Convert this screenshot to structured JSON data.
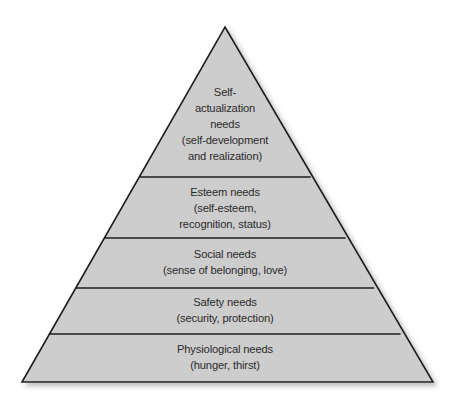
{
  "diagram": {
    "name": "maslow-hierarchy-of-needs-pyramid",
    "type": "pyramid",
    "background_color": "#ffffff",
    "fill_color": "#cdcdcd",
    "outline_color": "#1c1c1c",
    "text_color": "#2b2b2b",
    "apex": {
      "x": 225,
      "y": 27
    },
    "base_left": {
      "x": 22,
      "y": 382
    },
    "base_right": {
      "x": 433,
      "y": 382
    },
    "divider_y": [
      177,
      238,
      288,
      334
    ],
    "tiers": [
      {
        "id": "tier-self-actualization",
        "level": 5,
        "position": "top",
        "lines": [
          "Self-",
          "actualization",
          "needs",
          "(self-development",
          "and realization)"
        ],
        "text_center_y": 128
      },
      {
        "id": "tier-esteem",
        "level": 4,
        "position": "fourth",
        "lines": [
          "Esteem needs",
          "(self-esteem,",
          "recognition, status)"
        ],
        "text_center_y": 208
      },
      {
        "id": "tier-social",
        "level": 3,
        "position": "middle",
        "lines": [
          "Social needs",
          "(sense of belonging, love)"
        ],
        "text_center_y": 263
      },
      {
        "id": "tier-safety",
        "level": 2,
        "position": "second",
        "lines": [
          "Safety needs",
          "(security, protection)"
        ],
        "text_center_y": 311
      },
      {
        "id": "tier-physiological",
        "level": 1,
        "position": "base",
        "lines": [
          "Physiological needs",
          "(hunger, thirst)"
        ],
        "text_center_y": 358
      }
    ]
  }
}
